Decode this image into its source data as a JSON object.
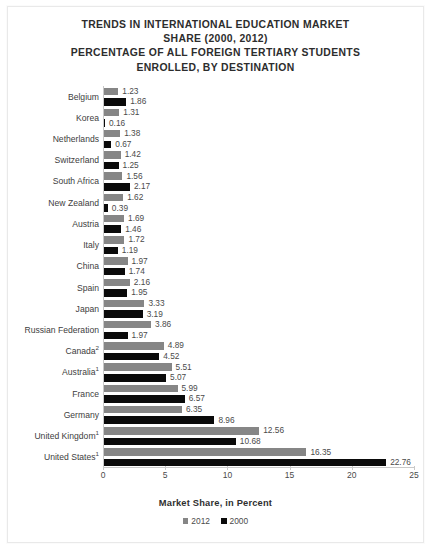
{
  "title": {
    "lines": [
      "TRENDS IN INTERNATIONAL EDUCATION MARKET",
      "SHARE (2000, 2012)",
      "PERCENTAGE OF ALL FOREIGN TERTIARY STUDENTS",
      "ENROLLED, BY DESTINATION"
    ]
  },
  "axis_title": "Market Share, in Percent",
  "legend": [
    {
      "label": "2012",
      "color": "#868686",
      "swatch": "square-swatch"
    },
    {
      "label": "2000",
      "color": "#0a0a0a",
      "swatch": "square-swatch"
    }
  ],
  "x_ticks": [
    "0",
    "5",
    "10",
    "15",
    "20",
    "25"
  ],
  "chart_data": {
    "type": "bar",
    "orientation": "horizontal",
    "title": "TRENDS IN INTERNATIONAL EDUCATION MARKET SHARE (2000, 2012) PERCENTAGE OF ALL FOREIGN TERTIARY STUDENTS ENROLLED, BY DESTINATION",
    "xlabel": "Market Share, in Percent",
    "ylabel": "",
    "xlim": [
      0,
      25
    ],
    "xticks": [
      0,
      5,
      10,
      15,
      20,
      25
    ],
    "grid": false,
    "legend_position": "bottom",
    "categories": [
      "Belgium",
      "Korea",
      "Netherlands",
      "Switzerland",
      "South Africa",
      "New Zealand",
      "Austria",
      "Italy",
      "China",
      "Spain",
      "Japan",
      "Russian Federation",
      "Canada",
      "Australia",
      "France",
      "Germany",
      "United Kingdom",
      "United States"
    ],
    "category_footnotes": [
      "",
      "",
      "",
      "",
      "",
      "",
      "",
      "",
      "",
      "",
      "",
      "",
      "2",
      "1",
      "",
      "",
      "1",
      "1"
    ],
    "series": [
      {
        "name": "2012",
        "color": "#868686",
        "values": [
          1.23,
          1.31,
          1.38,
          1.42,
          1.56,
          1.62,
          1.69,
          1.72,
          1.97,
          2.16,
          3.33,
          3.86,
          4.89,
          5.51,
          5.99,
          6.35,
          12.56,
          16.35
        ]
      },
      {
        "name": "2000",
        "color": "#0a0a0a",
        "values": [
          1.86,
          0.16,
          0.67,
          1.25,
          2.17,
          0.39,
          1.46,
          1.19,
          1.74,
          1.95,
          3.19,
          1.97,
          4.52,
          5.07,
          6.57,
          8.96,
          10.68,
          22.76
        ]
      }
    ],
    "value_labels": {
      "2012": [
        "1.23",
        "1.31",
        "1.38",
        "1.42",
        "1.56",
        "1.62",
        "1.69",
        "1.72",
        "1.97",
        "2.16",
        "3.33",
        "3.86",
        "4.89",
        "5.51",
        "5.99",
        "6.35",
        "12.56",
        "16.35"
      ],
      "2000": [
        "1.86",
        "0.16",
        "0.67",
        "1.25",
        "2.17",
        "0.39",
        "1.46",
        "1.19",
        "1.74",
        "1.95",
        "3.19",
        "1.97",
        "4.52",
        "5.07",
        "6.57",
        "8.96",
        "10.68",
        "22.76"
      ]
    }
  }
}
